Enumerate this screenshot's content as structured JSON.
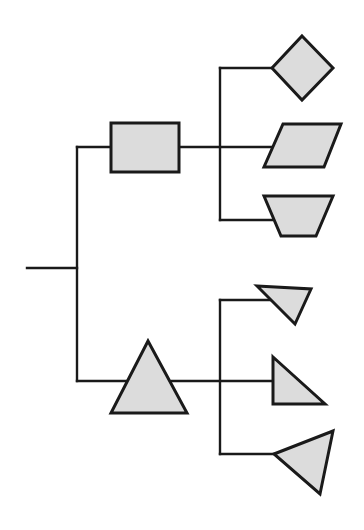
{
  "diagram": {
    "type": "tree",
    "colors": {
      "stroke": "#1a1a1a",
      "fill": "#dcdcdc",
      "background": "#ffffff"
    },
    "root": {
      "children": [
        {
          "shape": "rectangle",
          "children": [
            {
              "shape": "diamond"
            },
            {
              "shape": "parallelogram"
            },
            {
              "shape": "trapezoid-inverted"
            }
          ]
        },
        {
          "shape": "triangle-equilateral",
          "children": [
            {
              "shape": "triangle-pointing-down-left"
            },
            {
              "shape": "triangle-right-angle"
            },
            {
              "shape": "triangle-pointing-left"
            }
          ]
        }
      ]
    }
  }
}
